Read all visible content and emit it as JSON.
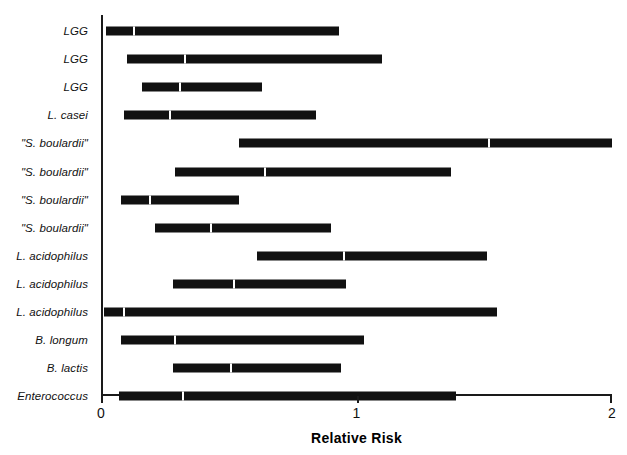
{
  "chart_data": {
    "type": "bar",
    "subtype": "confidence-interval-forest-plot",
    "title": "",
    "xlabel": "Relative Risk",
    "ylabel": "",
    "xlim": [
      0,
      2
    ],
    "xticks": [
      0,
      1,
      2
    ],
    "xticklabels": [
      "0",
      "1",
      "2"
    ],
    "grid": false,
    "legend": null,
    "categories": [
      "LGG",
      "LGG",
      "LGG",
      "L. casei",
      "\"S. boulardii\"",
      "\"S. boulardii\"",
      "\"S. boulardii\"",
      "\"S. boulardii\"",
      "L. acidophilus",
      "L. acidophilus",
      "L. acidophilus",
      "B. longum",
      "B. lactis",
      "Enterococcus"
    ],
    "series": [
      {
        "name": "Relative Risk with 95% CI",
        "points": [
          {
            "label": "LGG",
            "low": 0.02,
            "estimate": 0.13,
            "high": 0.93
          },
          {
            "label": "LGG",
            "low": 0.1,
            "estimate": 0.33,
            "high": 1.1
          },
          {
            "label": "LGG",
            "low": 0.16,
            "estimate": 0.31,
            "high": 0.63
          },
          {
            "label": "L. casei",
            "low": 0.09,
            "estimate": 0.27,
            "high": 0.84
          },
          {
            "label": "\"S. boulardii\"",
            "low": 0.54,
            "estimate": 1.52,
            "high": 2.0
          },
          {
            "label": "\"S. boulardii\"",
            "low": 0.29,
            "estimate": 0.64,
            "high": 1.37
          },
          {
            "label": "\"S. boulardii\"",
            "low": 0.08,
            "estimate": 0.19,
            "high": 0.54
          },
          {
            "label": "\"S. boulardii\"",
            "low": 0.21,
            "estimate": 0.43,
            "high": 0.9
          },
          {
            "label": "L. acidophilus",
            "low": 0.61,
            "estimate": 0.95,
            "high": 1.51
          },
          {
            "label": "L. acidophilus",
            "low": 0.28,
            "estimate": 0.52,
            "high": 0.96
          },
          {
            "label": "L. acidophilus",
            "low": 0.01,
            "estimate": 0.09,
            "high": 1.55
          },
          {
            "label": "B. longum",
            "low": 0.08,
            "estimate": 0.29,
            "high": 1.03
          },
          {
            "label": "B. lactis",
            "low": 0.28,
            "estimate": 0.51,
            "high": 0.94
          },
          {
            "label": "Enterococcus",
            "low": 0.07,
            "estimate": 0.32,
            "high": 1.39
          }
        ]
      }
    ]
  },
  "axis": {
    "x_title": "Relative Risk",
    "ticks": [
      "0",
      "1",
      "2"
    ]
  },
  "colors": {
    "bar": "#111111",
    "axis": "#1a1a1a",
    "background": "#ffffff",
    "marker": "#ffffff"
  }
}
